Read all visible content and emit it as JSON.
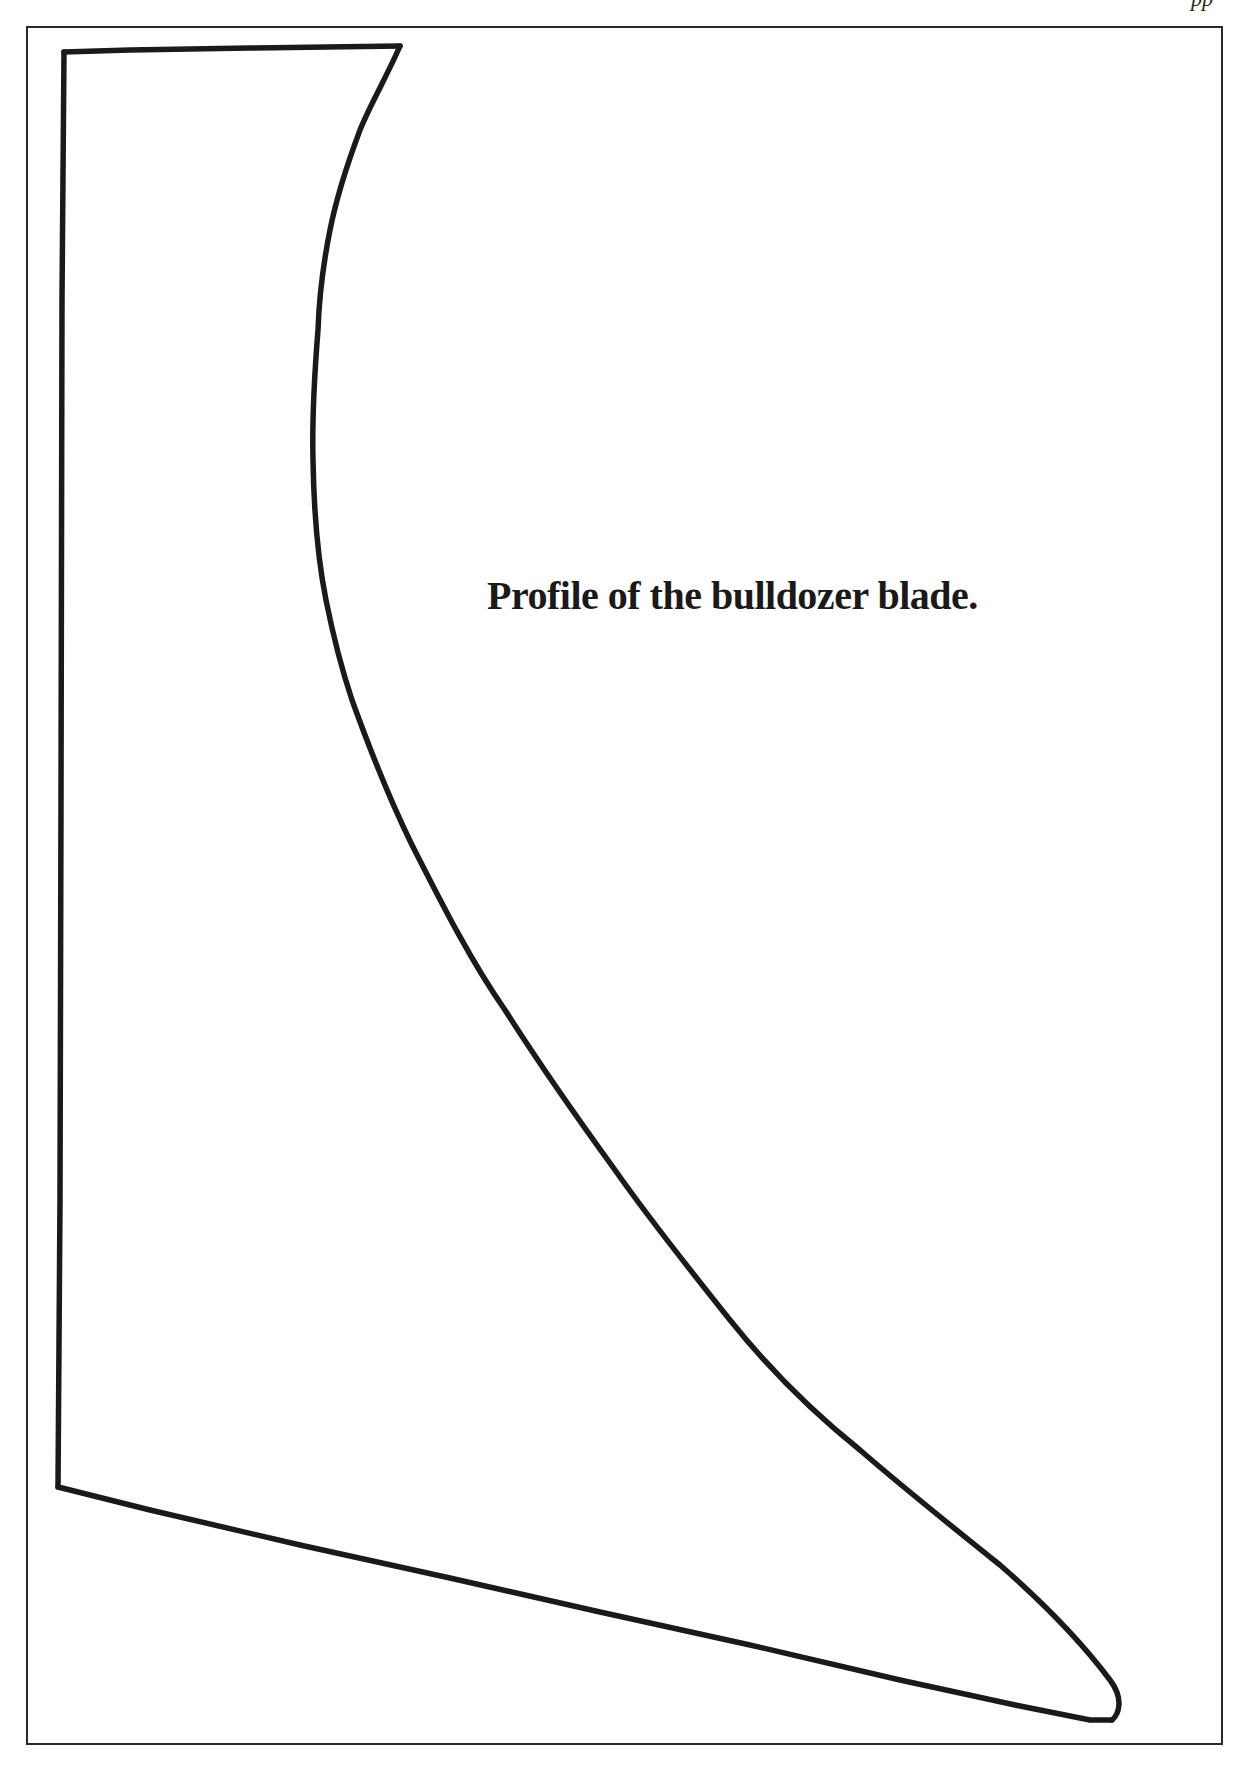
{
  "page": {
    "header_fragment": "pp",
    "caption": "Profile of the bulldozer blade."
  },
  "figure": {
    "type": "line-drawing",
    "stroke_color": "#1a1a1a",
    "frame_color": "#2a2a2a"
  }
}
